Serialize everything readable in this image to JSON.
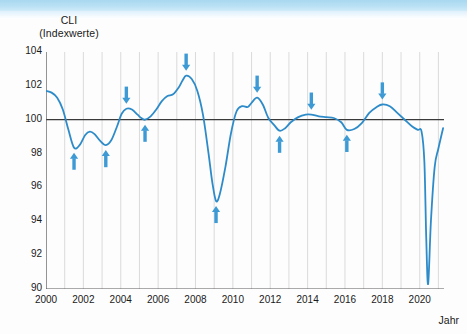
{
  "chart_data": {
    "type": "line",
    "title": "CLI",
    "subtitle": "(Indexwerte)",
    "ylabel": "CLI (Indexwerte)",
    "xlabel": "Jahr",
    "ylim": [
      90,
      104
    ],
    "xlim": [
      2000,
      2021.3
    ],
    "yticks": [
      90,
      92,
      94,
      96,
      98,
      100,
      102,
      104
    ],
    "xticks": [
      2000,
      2002,
      2004,
      2006,
      2008,
      2010,
      2012,
      2014,
      2016,
      2018,
      2020
    ],
    "xtick_labels": [
      "2000",
      "2002",
      "2004",
      "2006",
      "2008",
      "2010",
      "2012",
      "2014",
      "2016",
      "2018",
      "2020"
    ],
    "grid": "vertical",
    "reference_line": 100,
    "legend": null,
    "series": [
      {
        "name": "CLI",
        "color": "#2e8bc9",
        "x": [
          2000.0,
          2000.3,
          2000.6,
          2000.9,
          2001.2,
          2001.5,
          2001.8,
          2002.1,
          2002.35,
          2002.6,
          2002.9,
          2003.2,
          2003.5,
          2003.8,
          2004.05,
          2004.3,
          2004.6,
          2004.9,
          2005.1,
          2005.3,
          2005.6,
          2005.9,
          2006.2,
          2006.5,
          2006.8,
          2007.1,
          2007.3,
          2007.5,
          2007.8,
          2008.1,
          2008.4,
          2008.7,
          2008.9,
          2009.1,
          2009.3,
          2009.6,
          2009.9,
          2010.2,
          2010.5,
          2010.8,
          2011.0,
          2011.3,
          2011.6,
          2011.9,
          2012.2,
          2012.5,
          2012.8,
          2013.1,
          2013.5,
          2013.9,
          2014.2,
          2014.6,
          2015.0,
          2015.4,
          2015.8,
          2016.1,
          2016.5,
          2016.9,
          2017.3,
          2017.7,
          2018.0,
          2018.4,
          2018.8,
          2019.2,
          2019.6,
          2019.9,
          2020.1,
          2020.25,
          2020.35,
          2020.45,
          2020.6,
          2020.8,
          2021.0,
          2021.25
        ],
        "y": [
          101.7,
          101.6,
          101.3,
          100.6,
          99.4,
          98.35,
          98.5,
          99.1,
          99.3,
          99.15,
          98.75,
          98.5,
          98.8,
          99.6,
          100.35,
          100.65,
          100.6,
          100.3,
          100.1,
          100.0,
          100.2,
          100.6,
          101.1,
          101.4,
          101.5,
          101.9,
          102.3,
          102.6,
          102.4,
          101.7,
          100.3,
          98.0,
          96.3,
          95.2,
          95.6,
          97.2,
          99.2,
          100.5,
          100.8,
          100.75,
          101.0,
          101.3,
          100.9,
          100.1,
          99.7,
          99.35,
          99.5,
          99.85,
          100.15,
          100.3,
          100.3,
          100.2,
          100.15,
          100.1,
          99.85,
          99.4,
          99.45,
          99.8,
          100.4,
          100.75,
          100.9,
          100.8,
          100.4,
          100.0,
          99.6,
          99.4,
          99.3,
          97.5,
          93.0,
          90.3,
          94.0,
          97.2,
          98.3,
          99.5
        ]
      }
    ],
    "annotations": {
      "up_arrows_label": "Tiefpunkt",
      "down_arrows_label": "Hochpunkt",
      "arrow_color": "#3d9ad4",
      "up": [
        {
          "x": 2001.5,
          "y": 98.35
        },
        {
          "x": 2003.2,
          "y": 98.5
        },
        {
          "x": 2005.3,
          "y": 100.0
        },
        {
          "x": 2009.1,
          "y": 95.2
        },
        {
          "x": 2012.5,
          "y": 99.35
        },
        {
          "x": 2016.1,
          "y": 99.4
        },
        {
          "x": 2020.45,
          "y": 90.3
        }
      ],
      "down": [
        {
          "x": 2004.3,
          "y": 100.65
        },
        {
          "x": 2007.5,
          "y": 102.6
        },
        {
          "x": 2011.3,
          "y": 101.3
        },
        {
          "x": 2014.2,
          "y": 100.3
        },
        {
          "x": 2018.0,
          "y": 100.9
        }
      ]
    },
    "colors": {
      "line": "#2e8bc9",
      "arrow": "#3d9ad4",
      "gridline": "#d6d6d6",
      "axis": "#595959",
      "reference": "#3a3a3a",
      "banner": "#a8d8f0"
    }
  }
}
